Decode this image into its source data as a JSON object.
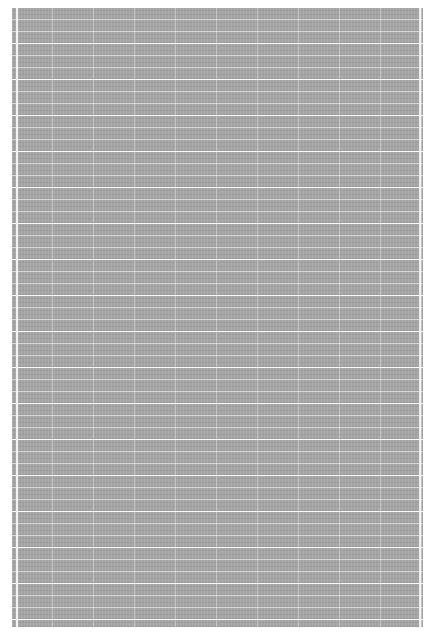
{
  "page": {
    "background_color": "#a4a4a4",
    "grid_line_color": "#ffffff",
    "content": "illegible dense grid texture",
    "row_spacing_px": 12,
    "column_spacing_px": 41
  }
}
